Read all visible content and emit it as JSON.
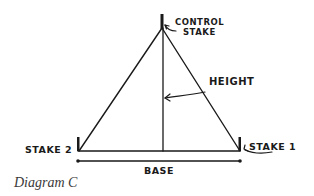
{
  "diagram": {
    "labels": {
      "control_stake_line1": "CONTROL",
      "control_stake_line2": "STAKE",
      "height": "HEIGHT",
      "stake_1": "STAKE 1",
      "stake_2": "STAKE 2",
      "base": "BASE"
    },
    "caption": "Diagram C",
    "colors": {
      "ink": "#1a1a1a",
      "caption": "#3a3a3a",
      "background": "#ffffff"
    }
  }
}
